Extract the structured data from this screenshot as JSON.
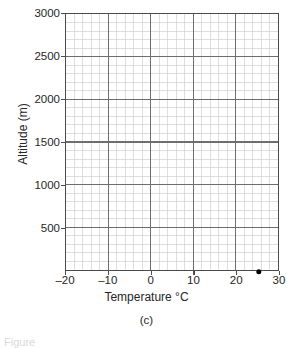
{
  "chart_data": {
    "type": "scatter",
    "title": "",
    "subtitle": "",
    "xlabel": "Temperature °C",
    "ylabel": "Altitude (m)",
    "xlim": [
      -20,
      30
    ],
    "ylim": [
      0,
      3000
    ],
    "xticks": [
      -20,
      -10,
      0,
      10,
      20,
      30
    ],
    "xtick_labels": [
      "–20",
      "–10",
      "0",
      "10",
      "20",
      "30"
    ],
    "yticks": [
      500,
      1000,
      1500,
      2000,
      2500,
      3000
    ],
    "ytick_labels": [
      "500",
      "1000",
      "1500",
      "2000",
      "2500",
      "3000"
    ],
    "x_major_step": 10,
    "x_minor_step": 2,
    "y_major_step": 500,
    "y_minor_step": 100,
    "grid": true,
    "grid_major_color": "#6e6e6e",
    "grid_minor_color": "#cfcfcf",
    "axis_color": "#4c4c4c",
    "legend": null,
    "legend_position": "none",
    "series": [
      {
        "name": "measurement",
        "marker": "filled-circle",
        "color": "#000000",
        "points": [
          {
            "x": 25,
            "y": 0
          }
        ]
      }
    ],
    "annotations": []
  },
  "figure": {
    "caption": "(c)",
    "footer_note": "Figure"
  }
}
